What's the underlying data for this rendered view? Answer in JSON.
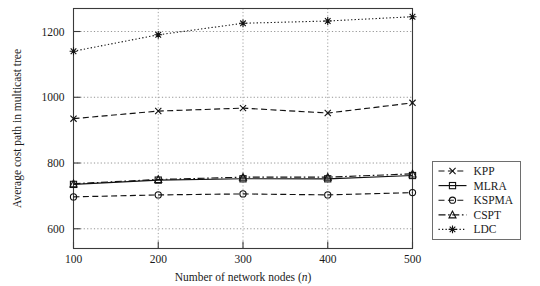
{
  "chart_data": {
    "type": "line",
    "title": "",
    "xlabel": "Number of network nodes (n)",
    "xlabel_main": "Number of network nodes (",
    "xlabel_italic": "n",
    "xlabel_tail": ")",
    "ylabel": "Average cost path in multicast tree",
    "x": [
      100,
      200,
      300,
      400,
      500
    ],
    "xticklabels": [
      "100",
      "200",
      "300",
      "400",
      "500"
    ],
    "yticklabels": [
      "600",
      "800",
      "1000",
      "1200"
    ],
    "yticks": [
      600,
      800,
      1000,
      1200
    ],
    "xlim": [
      100,
      500
    ],
    "ylim": [
      540,
      1270
    ],
    "grid": "both",
    "legend_position": "right-outside",
    "series": [
      {
        "name": "KPP",
        "marker": "x",
        "dash": "dashed",
        "values": [
          935,
          958,
          967,
          952,
          983
        ]
      },
      {
        "name": "MLRA",
        "marker": "square",
        "dash": "solid",
        "values": [
          735,
          748,
          752,
          752,
          762
        ]
      },
      {
        "name": "KSPMA",
        "marker": "circle",
        "dash": "dashed",
        "values": [
          697,
          703,
          706,
          703,
          710
        ]
      },
      {
        "name": "CSPT",
        "marker": "triangle",
        "dash": "dash-dot",
        "values": [
          737,
          750,
          757,
          757,
          767
        ]
      },
      {
        "name": "LDC",
        "marker": "asterisk",
        "dash": "dotted",
        "values": [
          1140,
          1190,
          1225,
          1232,
          1245
        ]
      }
    ]
  },
  "legend": {
    "entries": [
      "KPP",
      "MLRA",
      "KSPMA",
      "CSPT",
      "LDC"
    ]
  },
  "colors": {
    "ink": "#111111",
    "axis": "#3a3a3a",
    "grid": "#8a8a8a",
    "background": "#ffffff"
  }
}
